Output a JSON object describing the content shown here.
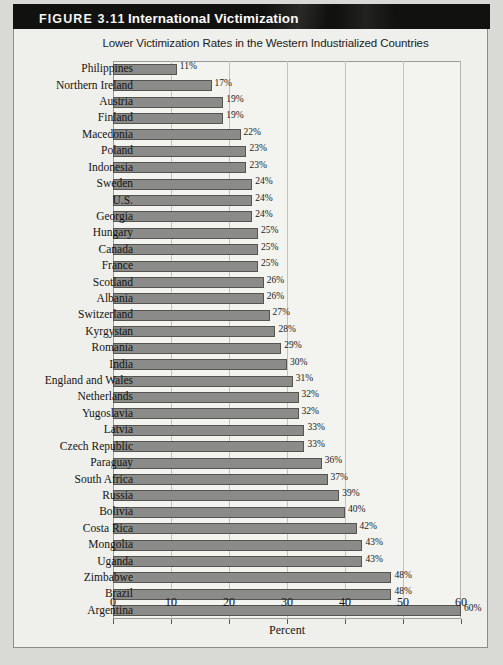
{
  "figure": {
    "label": "FIGURE 3.11",
    "title": "International Victimization",
    "subtitle": "Lower Victimization Rates in the Western Industrialized Countries"
  },
  "colors": {
    "header_bar": "#111110",
    "bar_fill": "#8b8b89",
    "bar_border": "#55544f",
    "panel_bg": "#efefeb",
    "page_bg": "#d9d9d5",
    "gridline": "#c2c2bf"
  },
  "chart_data": {
    "type": "bar",
    "orientation": "horizontal",
    "title": "International Victimization",
    "subtitle": "Lower Victimization Rates in the Western Industrialized Countries",
    "xlabel": "Percent",
    "ylabel": "",
    "xlim": [
      0,
      60
    ],
    "xticks": [
      0,
      10,
      20,
      30,
      40,
      50,
      60
    ],
    "xtick_labels": [
      "0",
      "10",
      "20",
      "30",
      "40",
      "50",
      "60"
    ],
    "grid": true,
    "grid_axis": "x",
    "legend": false,
    "value_label_suffix": "%",
    "categories": [
      "Philippines",
      "Northern Ireland",
      "Austria",
      "Finland",
      "Macedonia",
      "Poland",
      "Indonesia",
      "Sweden",
      "U.S.",
      "Georgia",
      "Hungary",
      "Canada",
      "France",
      "Scotland",
      "Albania",
      "Switzerland",
      "Kyrgystan",
      "Romania",
      "India",
      "England and Wales",
      "Netherlands",
      "Yugoslavia",
      "Latvia",
      "Czech Republic",
      "Paraguay",
      "South Africa",
      "Russia",
      "Bolivia",
      "Costa Rica",
      "Mongolia",
      "Uganda",
      "Zimbabwe",
      "Brazil",
      "Argentina"
    ],
    "values": [
      11,
      17,
      19,
      19,
      22,
      23,
      23,
      24,
      24,
      24,
      25,
      25,
      25,
      26,
      26,
      27,
      28,
      29,
      30,
      31,
      32,
      32,
      33,
      33,
      36,
      37,
      39,
      40,
      42,
      43,
      43,
      48,
      48,
      60
    ],
    "value_labels": [
      "11%",
      "17%",
      "19%",
      "19%",
      "22%",
      "23%",
      "23%",
      "24%",
      "24%",
      "24%",
      "25%",
      "25%",
      "25%",
      "26%",
      "26%",
      "27%",
      "28%",
      "29%",
      "30%",
      "31%",
      "32%",
      "32%",
      "33%",
      "33%",
      "36%",
      "37%",
      "39%",
      "40%",
      "42%",
      "43%",
      "43%",
      "48%",
      "48%",
      "60%"
    ]
  }
}
